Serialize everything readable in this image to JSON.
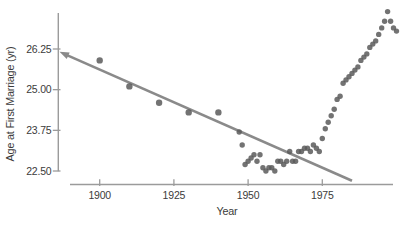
{
  "figure": {
    "background_color": "#ffffff"
  },
  "chart_data": {
    "type": "scatter",
    "title": "",
    "xlabel": "Year",
    "ylabel": "Age at First Marriage (yr)",
    "x_ticks": [
      1900,
      1925,
      1950,
      1975
    ],
    "x_tick_labels": [
      "1900",
      "1925",
      "1950",
      "1975"
    ],
    "y_ticks": [
      26.25,
      25.0,
      23.75,
      22.5
    ],
    "y_tick_labels": [
      "26.25",
      "25.00",
      "23.75",
      "22.50"
    ],
    "xlim": [
      1886,
      2004
    ],
    "ylim": [
      22.0,
      27.6
    ],
    "grid": false,
    "legend": null,
    "series_name": "Median age at first marriage",
    "points": [
      [
        1900,
        25.9
      ],
      [
        1910,
        25.1
      ],
      [
        1920,
        24.6
      ],
      [
        1930,
        24.3
      ],
      [
        1940,
        24.3
      ],
      [
        1947,
        23.7
      ],
      [
        1948,
        23.3
      ],
      [
        1949,
        22.7
      ],
      [
        1950,
        22.8
      ],
      [
        1951,
        22.9
      ],
      [
        1952,
        23.0
      ],
      [
        1953,
        22.8
      ],
      [
        1954,
        23.0
      ],
      [
        1955,
        22.6
      ],
      [
        1956,
        22.5
      ],
      [
        1957,
        22.6
      ],
      [
        1958,
        22.6
      ],
      [
        1959,
        22.5
      ],
      [
        1960,
        22.8
      ],
      [
        1961,
        22.8
      ],
      [
        1962,
        22.7
      ],
      [
        1963,
        22.8
      ],
      [
        1964,
        23.1
      ],
      [
        1965,
        22.8
      ],
      [
        1966,
        22.8
      ],
      [
        1967,
        23.1
      ],
      [
        1968,
        23.1
      ],
      [
        1969,
        23.2
      ],
      [
        1970,
        23.2
      ],
      [
        1971,
        23.1
      ],
      [
        1972,
        23.3
      ],
      [
        1973,
        23.2
      ],
      [
        1974,
        23.1
      ],
      [
        1975,
        23.5
      ],
      [
        1976,
        23.8
      ],
      [
        1977,
        24.0
      ],
      [
        1978,
        24.2
      ],
      [
        1979,
        24.4
      ],
      [
        1980,
        24.7
      ],
      [
        1981,
        24.8
      ],
      [
        1982,
        25.2
      ],
      [
        1983,
        25.3
      ],
      [
        1984,
        25.4
      ],
      [
        1985,
        25.5
      ],
      [
        1986,
        25.6
      ],
      [
        1987,
        25.7
      ],
      [
        1988,
        25.9
      ],
      [
        1989,
        26.0
      ],
      [
        1990,
        26.1
      ],
      [
        1991,
        26.3
      ],
      [
        1992,
        26.4
      ],
      [
        1993,
        26.5
      ],
      [
        1994,
        26.7
      ],
      [
        1995,
        26.9
      ],
      [
        1996,
        27.1
      ],
      [
        1997,
        27.4
      ],
      [
        1998,
        27.1
      ],
      [
        1999,
        26.9
      ],
      [
        2000,
        26.8
      ]
    ],
    "trend_line": {
      "x1": 1888,
      "y1": 26.1,
      "x2": 1985,
      "y2": 22.2,
      "arrow": "start"
    },
    "colors": {
      "point": "#5a5a5a",
      "trend": "#8a8a8a",
      "axis": "#9b9b9b",
      "text": "#3b3b3b"
    }
  }
}
